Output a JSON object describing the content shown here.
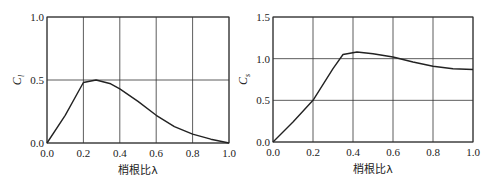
{
  "chart_data": [
    {
      "type": "line",
      "title": "",
      "xlabel": "梢根比λ",
      "ylabel": "C_l",
      "ylabel_main": "C",
      "ylabel_sub": "l",
      "xlim": [
        0.0,
        1.0
      ],
      "ylim": [
        0.0,
        1.0
      ],
      "grid": true,
      "xticks": [
        "0.0",
        "0.2",
        "0.4",
        "0.6",
        "0.8",
        "1.0"
      ],
      "yticks": [
        "0.0",
        "0.5",
        "1.0"
      ],
      "series": [
        {
          "name": "C_l",
          "x": [
            0.0,
            0.1,
            0.2,
            0.27,
            0.35,
            0.4,
            0.5,
            0.6,
            0.7,
            0.75,
            0.8,
            0.9,
            1.0
          ],
          "y": [
            0.0,
            0.22,
            0.48,
            0.5,
            0.47,
            0.43,
            0.33,
            0.22,
            0.13,
            0.1,
            0.07,
            0.03,
            0.0
          ]
        }
      ]
    },
    {
      "type": "line",
      "title": "",
      "xlabel": "梢根比λ",
      "ylabel": "C_s",
      "ylabel_main": "C",
      "ylabel_sub": "s",
      "xlim": [
        0.0,
        1.0
      ],
      "ylim": [
        0.0,
        1.5
      ],
      "grid": true,
      "xticks": [
        "0.0",
        "0.2",
        "0.4",
        "0.6",
        "0.8",
        "1.0"
      ],
      "yticks": [
        "0.0",
        "0.5",
        "1.0",
        "1.5"
      ],
      "series": [
        {
          "name": "C_s",
          "x": [
            0.0,
            0.1,
            0.2,
            0.3,
            0.35,
            0.42,
            0.5,
            0.6,
            0.7,
            0.8,
            0.9,
            1.0
          ],
          "y": [
            0.0,
            0.24,
            0.5,
            0.88,
            1.05,
            1.08,
            1.06,
            1.02,
            0.96,
            0.91,
            0.88,
            0.87
          ]
        }
      ]
    }
  ]
}
